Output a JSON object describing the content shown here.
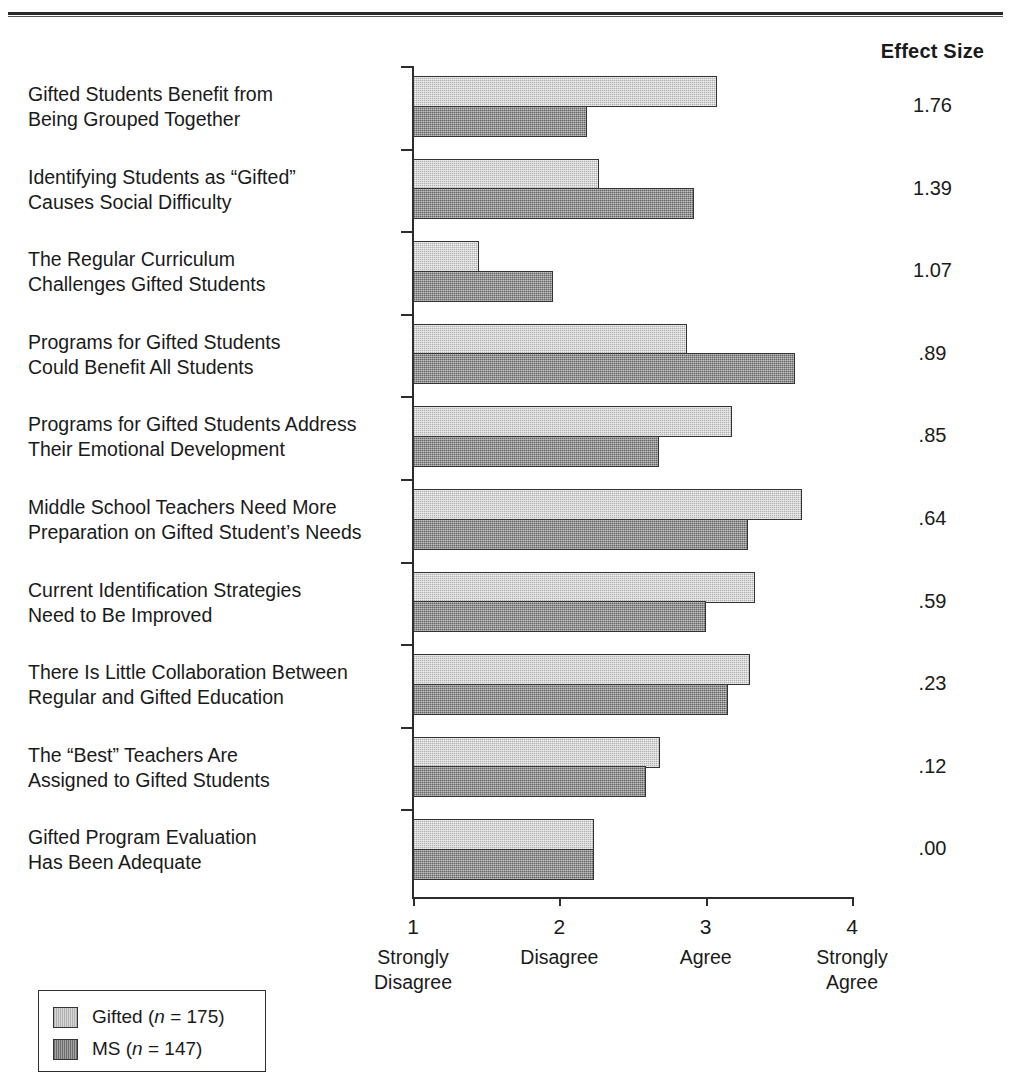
{
  "header": {
    "effect_size_label": "Effect Size"
  },
  "chart_data": {
    "type": "bar",
    "orientation": "horizontal",
    "title": "",
    "xlabel": "",
    "ylabel": "",
    "xlim": [
      1,
      4
    ],
    "grid": false,
    "legend_position": "bottom-left",
    "categories": [
      "Gifted Students Benefit from\nBeing Grouped Together",
      "Identifying Students as “Gifted”\nCauses Social Difficulty",
      "The Regular Curriculum\nChallenges Gifted Students",
      "Programs for Gifted Students\nCould Benefit All Students",
      "Programs for Gifted Students Address\nTheir Emotional Development",
      "Middle School Teachers Need More\nPreparation on Gifted Student’s Needs",
      "Current Identification Strategies\nNeed to Be Improved",
      "There Is Little Collaboration Between\nRegular and Gifted Education",
      "The “Best” Teachers Are\nAssigned to Gifted Students",
      "Gifted Program Evaluation\nHas Been Adequate"
    ],
    "series": [
      {
        "name": "Gifted (n = 175)",
        "color": "#c9c9c9",
        "values": [
          3.08,
          2.27,
          1.45,
          2.87,
          3.18,
          3.66,
          3.34,
          3.3,
          2.69,
          2.24
        ]
      },
      {
        "name": "MS (n = 147)",
        "color": "#8f8f8f",
        "values": [
          2.19,
          2.92,
          1.96,
          3.61,
          2.68,
          3.29,
          3.0,
          3.15,
          2.59,
          2.24
        ]
      }
    ],
    "effect_sizes": [
      "1.76",
      "1.39",
      "1.07",
      ".89",
      ".85",
      ".64",
      ".59",
      ".23",
      ".12",
      ".00"
    ],
    "xticks": [
      {
        "value": 1,
        "number": "1",
        "label": "Strongly\nDisagree"
      },
      {
        "value": 2,
        "number": "2",
        "label": "Disagree"
      },
      {
        "value": 3,
        "number": "3",
        "label": "Agree"
      },
      {
        "value": 4,
        "number": "4",
        "label": "Strongly\nAgree"
      }
    ]
  },
  "legend": {
    "items": [
      {
        "name_prefix": "Gifted (",
        "italic": "n",
        "name_suffix": " = 175)",
        "full": "Gifted (n = 175)",
        "swatch": "light"
      },
      {
        "name_prefix": "MS (",
        "italic": "n",
        "name_suffix": " = 147)",
        "full": "MS (n = 147)",
        "swatch": "dark"
      }
    ]
  }
}
